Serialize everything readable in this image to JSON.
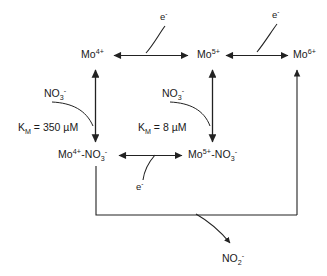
{
  "diagram": {
    "stroke_color": "#222222",
    "background_color": "#ffffff",
    "species": {
      "mo4": {
        "base": "Mo",
        "charge": "4+",
        "full": "Mo4+"
      },
      "mo5": {
        "base": "Mo",
        "charge": "5+",
        "full": "Mo5+"
      },
      "mo6": {
        "base": "Mo",
        "charge": "6+",
        "full": "Mo6+"
      }
    },
    "complexes": {
      "mo4_nitrate": {
        "metal": "Mo",
        "metal_charge": "4+",
        "dash": "-NO",
        "ligand_sub": "3",
        "ligand_charge": "-"
      },
      "mo5_nitrate": {
        "metal": "Mo",
        "metal_charge": "5+",
        "dash": "-NO",
        "ligand_sub": "3",
        "ligand_charge": "-"
      }
    },
    "ligands": {
      "nitrate_left": {
        "base": "NO",
        "sub": "3",
        "charge": "-"
      },
      "nitrate_middle": {
        "base": "NO",
        "sub": "3",
        "charge": "-"
      },
      "nitrite_product": {
        "base": "NO",
        "sub": "2",
        "charge": "-"
      }
    },
    "electrons": {
      "e_top_left": {
        "base": "e",
        "charge": "-"
      },
      "e_top_right": {
        "base": "e",
        "charge": "-"
      },
      "e_bottom": {
        "base": "e",
        "charge": "-"
      }
    },
    "kinetics": {
      "km_left": {
        "symbol": "K",
        "subscript": "M",
        "equals": " = ",
        "value": "350",
        "unit": " µM"
      },
      "km_middle": {
        "symbol": "K",
        "subscript": "M",
        "equals": " = ",
        "value": "8",
        "unit": " µM"
      }
    }
  }
}
